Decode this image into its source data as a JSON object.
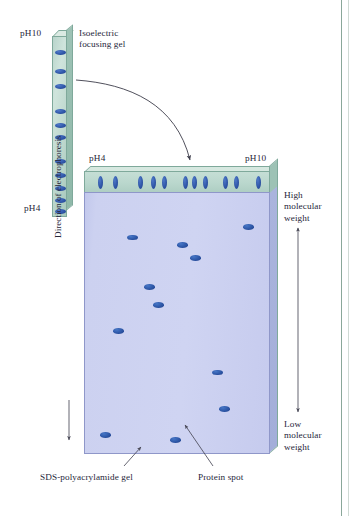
{
  "figure": {
    "background": "#ffffff",
    "width": 351,
    "height": 516
  },
  "colors": {
    "gel_green": "#bad7cd",
    "gel_green_edge": "#7fa99b",
    "page_blue": "#ccd1f0",
    "page_blue_edge": "#8f97c9",
    "spot_blue": "#2d56a6",
    "text": "#26263a",
    "leader_line": "#4a4a58"
  },
  "labels": {
    "isoelectric_focusing_gel": "Isoelectric\nfocusing gel",
    "direction_of_electrophoresis": "Direction of electrophoresis",
    "high_molecular_weight": "High\nmolecular\nweight",
    "low_molecular_weight": "Low\nmolecular\nweight",
    "sds_polyacrylamide_gel": "SDS-polyacrylamide gel",
    "protein_spot": "Protein spot"
  },
  "ief_strip": {
    "ph_top_label": "pH10",
    "ph_bottom_label": "pH4",
    "orientation": "vertical",
    "band_count": 11,
    "bands_y_pct": [
      7,
      18,
      26,
      40,
      48,
      55,
      68,
      76,
      83,
      90,
      96
    ]
  },
  "sds_gel": {
    "ph_left_label": "pH4",
    "ph_right_label": "pH10",
    "lane_band_count": 12,
    "lane_bands_x_pct": [
      7,
      15,
      29,
      36,
      42,
      53,
      58,
      64,
      75,
      81,
      93
    ],
    "lane_bands_x_pct_full": [
      7,
      15,
      29,
      36,
      42,
      53,
      58,
      64,
      75,
      81,
      93,
      47
    ],
    "protein_spots": [
      {
        "x_pct": 23,
        "y_pct": 16
      },
      {
        "x_pct": 50,
        "y_pct": 19
      },
      {
        "x_pct": 57,
        "y_pct": 24
      },
      {
        "x_pct": 86,
        "y_pct": 12
      },
      {
        "x_pct": 32,
        "y_pct": 35
      },
      {
        "x_pct": 37,
        "y_pct": 42
      },
      {
        "x_pct": 15,
        "y_pct": 52
      },
      {
        "x_pct": 69,
        "y_pct": 68
      },
      {
        "x_pct": 73,
        "y_pct": 82
      },
      {
        "x_pct": 8,
        "y_pct": 92
      },
      {
        "x_pct": 46,
        "y_pct": 94
      }
    ]
  },
  "annotations": {
    "transfer_arrow": "curved-arrow-ief-to-sds",
    "mw_axis_arrow": "double-headed-vertical-arrow",
    "electrophoresis_arrow": "down-arrow"
  }
}
